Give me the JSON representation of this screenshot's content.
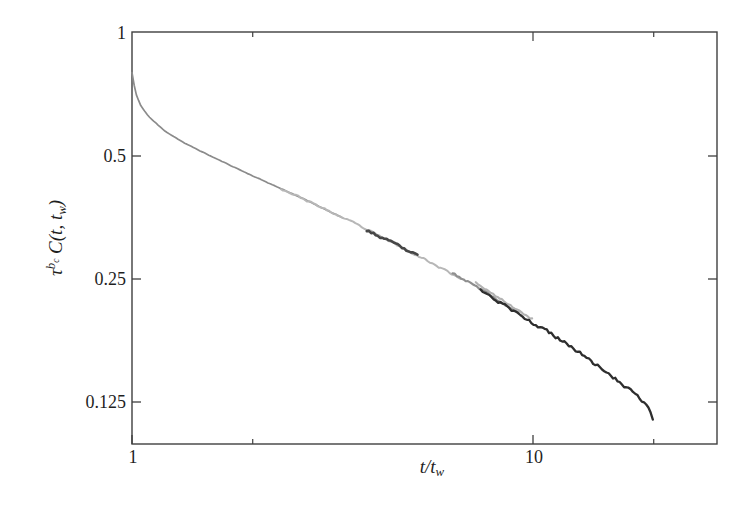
{
  "chart_data": {
    "type": "line",
    "title": "",
    "background": "#ffffff",
    "frame_color": "#3f3f3f",
    "text_color": "#1f1f1f",
    "grid": false,
    "legend": "none",
    "ylabel_segments": [
      {
        "text": "τ",
        "style": "base"
      },
      {
        "text": "b",
        "style": "sup"
      },
      {
        "text": "c",
        "style": "supsub"
      },
      {
        "text": " C(t, t",
        "style": "base"
      },
      {
        "text": "w",
        "style": "sub"
      },
      {
        "text": ")",
        "style": "base"
      }
    ],
    "xlabel_segments": [
      {
        "text": "t/t",
        "style": "base"
      },
      {
        "text": "w",
        "style": "sub"
      }
    ],
    "x_axis": {
      "scale": "log",
      "range": [
        1,
        28.8
      ],
      "tick_labels": [
        {
          "value": 1,
          "label": "1"
        },
        {
          "value": 10,
          "label": "10"
        }
      ],
      "major_tick_values": [
        1,
        10
      ],
      "minor_tick_values": [
        2,
        20
      ],
      "top_tick_values": [
        2,
        10,
        20
      ]
    },
    "y_axis": {
      "scale": "log",
      "range": [
        0.0987,
        1
      ],
      "tick_labels": [
        {
          "value": 1,
          "label": "1"
        },
        {
          "value": 0.5,
          "label": "0.5"
        },
        {
          "value": 0.25,
          "label": "0.25"
        },
        {
          "value": 0.125,
          "label": "0.125"
        }
      ],
      "tick_line_values": [
        0.5,
        0.25,
        0.125
      ],
      "right_tick_values": [
        0.5,
        0.25,
        0.125
      ]
    },
    "master_curve": {
      "comment": "collapsed master curve read off the figure; y = tau^bc C plotted against t/tw",
      "x": [
        1.0,
        1.02,
        1.05,
        1.1,
        1.2,
        1.35,
        1.55,
        2.0,
        2.6,
        3.5,
        5.0,
        7.0,
        10.0,
        12.0,
        14.0,
        16.0,
        17.0,
        18.0,
        19.0,
        19.5,
        19.9
      ],
      "y": [
        0.8,
        0.715,
        0.665,
        0.625,
        0.578,
        0.538,
        0.503,
        0.447,
        0.398,
        0.346,
        0.29,
        0.243,
        0.195,
        0.175,
        0.157,
        0.143,
        0.136,
        0.13,
        0.1235,
        0.119,
        0.1135
      ]
    },
    "series": [
      {
        "name": "tw-smooth",
        "x_start": 1.0,
        "x_end": 3.35,
        "color": "#8b8b8b",
        "width": 1.7,
        "noise": 0.0012,
        "offset": 1.0,
        "seed": 11
      },
      {
        "name": "tw-light-a",
        "x_start": 2.35,
        "x_end": 6.6,
        "color": "#b7b7b7",
        "width": 2.0,
        "noise": 0.005,
        "offset": 1.0,
        "seed": 23
      },
      {
        "name": "tw-mid",
        "x_start": 6.3,
        "x_end": 9.2,
        "color": "#8f8f8f",
        "width": 2.2,
        "noise": 0.006,
        "offset": 1.004,
        "seed": 37
      },
      {
        "name": "tw-dark-blob",
        "x_start": 3.85,
        "x_end": 5.15,
        "color": "#474747",
        "width": 2.6,
        "noise": 0.007,
        "offset": 0.998,
        "seed": 53
      },
      {
        "name": "tw-light-b",
        "x_start": 7.2,
        "x_end": 9.95,
        "color": "#b3b3b3",
        "width": 2.1,
        "noise": 0.007,
        "offset": 1.022,
        "seed": 67
      },
      {
        "name": "tw-dark-final",
        "x_start": 7.4,
        "x_end": 19.9,
        "color": "#2e2e2e",
        "width": 2.3,
        "noise": 0.01,
        "offset": 1.0,
        "seed": 83
      }
    ]
  }
}
